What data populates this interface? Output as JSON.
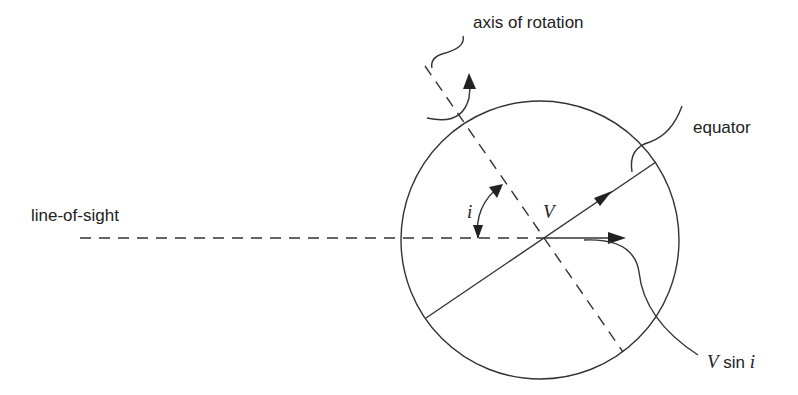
{
  "diagram": {
    "labels": {
      "axis_of_rotation": "axis of rotation",
      "equator": "equator",
      "line_of_sight": "line-of-sight",
      "velocity": "V",
      "inclination": "i",
      "projected_velocity_V": "V",
      "projected_velocity_rest": " sin ",
      "projected_velocity_i": "i"
    },
    "colors": {
      "stroke": "#333333",
      "text": "#222222",
      "background": "#ffffff"
    }
  }
}
